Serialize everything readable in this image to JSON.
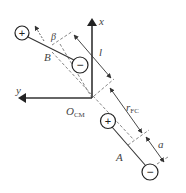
{
  "diagram": {
    "type": "dipole-geometry",
    "axes": {
      "x_label": "x",
      "y_label": "y",
      "origin_label_main": "O",
      "origin_label_sub": "CM"
    },
    "dipoles": [
      {
        "name": "B",
        "label": "B",
        "positive_symbol": "+",
        "negative_symbol": "−"
      },
      {
        "name": "A",
        "label": "A",
        "positive_symbol": "+",
        "negative_symbol": "−"
      }
    ],
    "dimensions": {
      "length_label": "l",
      "angle_label": "β",
      "distance_label_main": "r",
      "distance_label_sub": "FC",
      "offset_label": "a"
    },
    "colors": {
      "stroke": "#333333",
      "dash": "#777777",
      "background": "#ffffff"
    }
  }
}
